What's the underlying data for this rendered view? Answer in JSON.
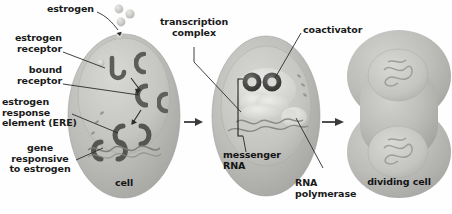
{
  "figure": {
    "type": "biological-process-diagram",
    "background_color": "#fefefe",
    "text_color": "#1a1a1a",
    "cell_fill": "#b9b9b7",
    "nucleus_fill": "#cfcfcc",
    "receptor_color": "#5e5e5c",
    "arrow_color": "#3a3a3a"
  },
  "labels": {
    "estrogen": "estrogen",
    "estrogen_receptor": "estrogen\nreceptor",
    "bound_receptor": "bound\nreceptor",
    "ere": "estrogen\nresponse\nelement (ERE)",
    "gene_responsive": "gene\nresponsive\nto estrogen",
    "cell": "cell",
    "transcription_complex": "transcription\ncomplex",
    "coactivator": "coactivator",
    "messenger_rna": "messenger\nRNA",
    "rna_polymerase": "RNA\npolymerase",
    "dividing_cell": "dividing cell"
  },
  "stages": [
    {
      "name": "cell",
      "caption": "cell",
      "parts": [
        "estrogen",
        "estrogen receptor",
        "bound receptor",
        "estrogen response element (ERE)",
        "gene responsive to estrogen"
      ]
    },
    {
      "name": "transcribing-cell",
      "caption": "",
      "parts": [
        "transcription complex",
        "coactivator",
        "messenger RNA",
        "RNA polymerase"
      ]
    },
    {
      "name": "dividing-cell",
      "caption": "dividing cell",
      "parts": []
    }
  ],
  "flow_arrows": [
    {
      "from": "cell",
      "to": "transcribing-cell"
    },
    {
      "from": "transcribing-cell",
      "to": "dividing-cell"
    }
  ],
  "estrogen_molecules": 3
}
